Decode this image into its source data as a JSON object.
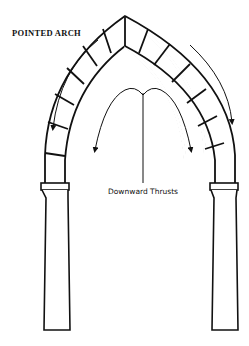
{
  "diagram": {
    "title": "POINTED ARCH",
    "annotation": "Downward Thrusts",
    "line_color": "#111111",
    "background": "#ffffff",
    "parts": [
      "arch voussoirs",
      "keystone joint at apex",
      "two column capitals",
      "two tapered columns",
      "outer thrust arrows",
      "central downward thrust arrows"
    ]
  }
}
